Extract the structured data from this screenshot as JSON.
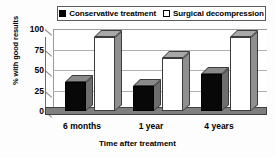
{
  "chart_data": {
    "type": "bar",
    "title": "",
    "subtitle": "",
    "xlabel": "Time after treatment",
    "ylabel": "% with good results",
    "categories": [
      "6 months",
      "1 year",
      "4 years"
    ],
    "series": [
      {
        "name": "Conservative treatment",
        "values": [
          35,
          30,
          45
        ],
        "color": "#000000",
        "marker": "filled-square"
      },
      {
        "name": "Surgical decompression",
        "values": [
          90,
          65,
          90
        ],
        "color": "#ffffff",
        "marker": "open-square"
      }
    ],
    "ylim": [
      0,
      100
    ],
    "yticks": [
      0,
      25,
      50,
      75,
      100
    ],
    "ytick_labels": [
      "0",
      "25",
      "50",
      "75",
      "100"
    ],
    "grid": true,
    "grid_axis": "y",
    "legend_position": "top-center",
    "style": "3d-column",
    "bar_colors": {
      "conservative_face": "#080808",
      "surgical_face": "#ffffff",
      "top_face": "#a8a8a8",
      "side_face": "#8f8f8f",
      "floor": "#7f7f7f",
      "gridline": "#b0b0b0",
      "axis": "#4a4a4a"
    }
  },
  "legend": {
    "entries": [
      {
        "label": "Conservative treatment",
        "swatch": "filled-square-icon"
      },
      {
        "label": "Surgical decompression",
        "swatch": "open-square-icon"
      }
    ]
  },
  "axes": {
    "y_title": "% with good results",
    "x_title": "Time after treatment",
    "y_ticks": [
      "100",
      "75",
      "50",
      "25",
      "0"
    ],
    "x_ticks": [
      "6 months",
      "1 year",
      "4 years"
    ]
  }
}
